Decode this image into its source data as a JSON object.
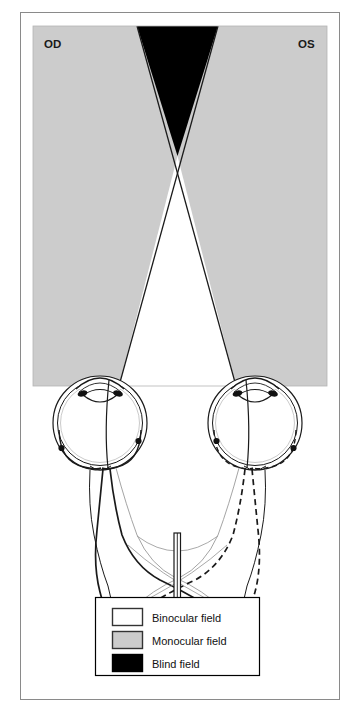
{
  "figure": {
    "title_labels": {
      "left_eye": "OD",
      "right_eye": "OS"
    },
    "colors": {
      "binocular_field": "#ffffff",
      "monocular_field": "#cccccc",
      "blind_field": "#000000",
      "outline": "#1a1a1a",
      "frame_border": "#808080",
      "legend_border": "#000000"
    },
    "legend": {
      "items": [
        {
          "label": "Binocular field",
          "swatch": "#ffffff",
          "swatch_name": "binocular-field-swatch"
        },
        {
          "label": "Monocular field",
          "swatch": "#cccccc",
          "swatch_name": "monocular-field-swatch"
        },
        {
          "label": "Blind field",
          "swatch": "#000000",
          "swatch_name": "blind-field-swatch"
        }
      ]
    },
    "anatomy": {
      "structures": [
        "left-eye-globe",
        "right-eye-globe",
        "left-optic-nerve",
        "right-optic-nerve",
        "optic-chiasm",
        "chiasm-lesion-marker",
        "left-optic-tract",
        "right-optic-tract"
      ]
    },
    "caption": "",
    "caption_faint": ""
  }
}
